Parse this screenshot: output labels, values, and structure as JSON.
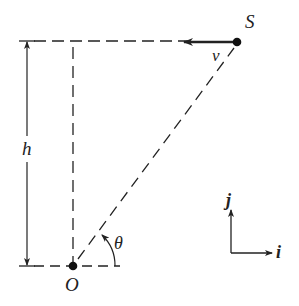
{
  "diagram": {
    "labels": {
      "point_s": "S",
      "point_o": "O",
      "velocity": "v",
      "height": "h",
      "angle": "θ",
      "unit_i": "i",
      "unit_j": "j"
    },
    "colors": {
      "stroke": "#222222",
      "background": "#ffffff"
    }
  }
}
